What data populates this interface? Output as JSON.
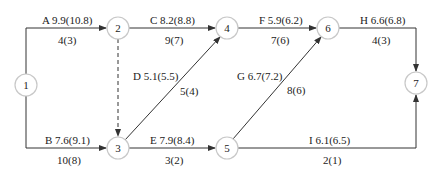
{
  "diagram": {
    "type": "activity-on-arrow network",
    "nodes": [
      {
        "id": "1",
        "label": "1",
        "x": 26,
        "y": 85
      },
      {
        "id": "2",
        "label": "2",
        "x": 118,
        "y": 28
      },
      {
        "id": "3",
        "label": "3",
        "x": 118,
        "y": 148
      },
      {
        "id": "4",
        "label": "4",
        "x": 227,
        "y": 28
      },
      {
        "id": "5",
        "label": "5",
        "x": 227,
        "y": 148
      },
      {
        "id": "6",
        "label": "6",
        "x": 328,
        "y": 28
      },
      {
        "id": "7",
        "label": "7",
        "x": 416,
        "y": 83
      }
    ],
    "edges": [
      {
        "id": "A",
        "from": "1",
        "to": "2",
        "cost_label": "A 9.9(10.8)",
        "duration_label": "4(3)"
      },
      {
        "id": "B",
        "from": "1",
        "to": "3",
        "cost_label": "B 7.6(9.1)",
        "duration_label": "10(8)"
      },
      {
        "id": "C",
        "from": "2",
        "to": "4",
        "cost_label": "C 8.2(8.8)",
        "duration_label": "9(7)"
      },
      {
        "id": "dummy",
        "from": "2",
        "to": "3",
        "style": "dashed"
      },
      {
        "id": "D",
        "from": "3",
        "to": "4",
        "cost_label": "D 5.1(5.5)",
        "duration_label": "5(4)"
      },
      {
        "id": "E",
        "from": "3",
        "to": "5",
        "cost_label": "E 7.9(8.4)",
        "duration_label": "3(2)"
      },
      {
        "id": "F",
        "from": "4",
        "to": "6",
        "cost_label": "F 5.9(6.2)",
        "duration_label": "7(6)"
      },
      {
        "id": "G",
        "from": "5",
        "to": "6",
        "cost_label": "G 6.7(7.2)",
        "duration_label": "8(6)"
      },
      {
        "id": "H",
        "from": "6",
        "to": "7",
        "cost_label": "H 6.6(6.8)",
        "duration_label": "4(3)"
      },
      {
        "id": "I",
        "from": "5",
        "to": "7",
        "cost_label": "I 6.1(6.5)",
        "duration_label": "2(1)"
      }
    ]
  },
  "colors": {
    "edge": "#333333",
    "node_border": "#c8c8c8",
    "text": "#222222"
  }
}
